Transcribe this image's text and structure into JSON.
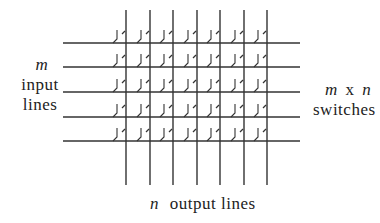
{
  "diagram": {
    "type": "crossbar-switch",
    "input_line_count": 5,
    "output_line_count": 7,
    "colors": {
      "line": "#333333",
      "text": "#222222",
      "background": "#ffffff"
    },
    "geometry": {
      "h_lines_y": [
        43,
        67,
        92,
        117,
        141
      ],
      "h_line_x_start": 63,
      "h_line_x_end": 300,
      "v_lines_x": [
        126,
        150,
        173,
        197,
        220,
        244,
        267
      ],
      "v_line_y_start": 10,
      "v_line_y_end": 185
    }
  },
  "labels": {
    "left": {
      "var": "m",
      "line1": "input",
      "line2": "lines"
    },
    "right": {
      "var_m": "m",
      "times": "x",
      "var_n": "n",
      "line2": "switches"
    },
    "bottom": {
      "var": "n",
      "text": "output lines"
    }
  }
}
